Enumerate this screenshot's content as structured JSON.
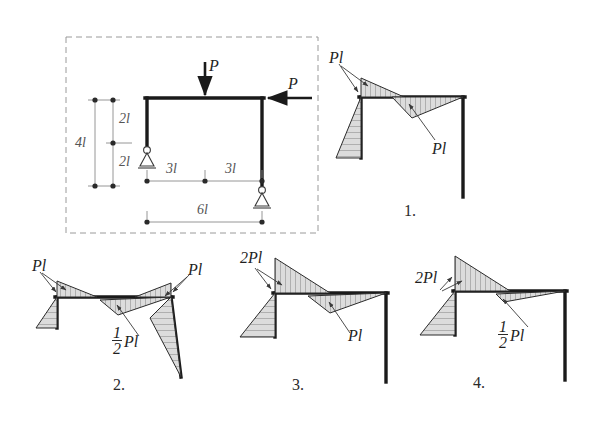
{
  "figure": {
    "type": "structural-engineering-multiple-choice"
  },
  "given_frame": {
    "loads": [
      {
        "name": "vertical-load",
        "label": "P",
        "direction": "down",
        "position": "beam-midspan"
      },
      {
        "name": "horizontal-load",
        "label": "P",
        "direction": "left",
        "position": "top-right-joint"
      }
    ],
    "dimensions": [
      {
        "label": "4l",
        "orientation": "vertical",
        "name": "total-height"
      },
      {
        "label": "2l",
        "orientation": "vertical",
        "name": "upper-height"
      },
      {
        "label": "2l",
        "orientation": "vertical",
        "name": "lower-height"
      },
      {
        "label": "3l",
        "orientation": "horizontal",
        "name": "left-half-span"
      },
      {
        "label": "3l",
        "orientation": "horizontal",
        "name": "right-half-span"
      },
      {
        "label": "6l",
        "orientation": "horizontal",
        "name": "total-span"
      }
    ],
    "supports": [
      {
        "name": "left-pin-support",
        "type": "pinned"
      },
      {
        "name": "right-pin-support",
        "type": "pinned"
      }
    ]
  },
  "options": [
    {
      "number": "1.",
      "labels": [
        {
          "text": "Pl",
          "name": "label-column-moment",
          "fraction": false
        },
        {
          "text": "Pl",
          "name": "label-beam-moment",
          "fraction": false
        }
      ]
    },
    {
      "number": "2.",
      "labels": [
        {
          "text": "Pl",
          "name": "label-left-column-moment",
          "fraction": false
        },
        {
          "text": "Pl",
          "name": "label-right-column-moment",
          "fraction": false
        },
        {
          "text": "Pl",
          "numerator": "1",
          "denominator": "2",
          "name": "label-beam-moment",
          "fraction": true
        }
      ]
    },
    {
      "number": "3.",
      "labels": [
        {
          "text": "2Pl",
          "name": "label-column-moment",
          "fraction": false
        },
        {
          "text": "Pl",
          "name": "label-beam-moment",
          "fraction": false
        }
      ]
    },
    {
      "number": "4.",
      "labels": [
        {
          "text": "2Pl",
          "name": "label-column-moment",
          "fraction": false
        },
        {
          "text": "Pl",
          "numerator": "1",
          "denominator": "2",
          "name": "label-beam-moment",
          "fraction": true
        }
      ]
    }
  ],
  "colors": {
    "frame_stroke": "#1a1a1a",
    "diagram_fill": "#d8d8d8",
    "diagram_stroke": "#2b2b2b",
    "dashed_border": "#9a9a9a",
    "dimension_line": "#7a7a7a",
    "background": "#ffffff"
  }
}
